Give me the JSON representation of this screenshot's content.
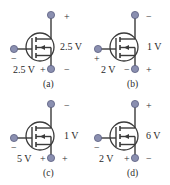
{
  "figure": {
    "colors": {
      "wire": "#3a3a3a",
      "node": "#8a8fb0",
      "text": "#2a2a2a"
    },
    "panels": [
      {
        "id": "a",
        "caption": "(a)",
        "vds_label": "2.5 V",
        "vgs_label": "2.5 V",
        "drain_sign": "+",
        "source_sign_right": "−",
        "source_sign_left": "+",
        "gate_sign": "−"
      },
      {
        "id": "b",
        "caption": "(b)",
        "vds_label": "1 V",
        "vgs_label": "2 V",
        "drain_sign": "−",
        "source_sign_right": "+",
        "source_sign_left": "−",
        "gate_sign": "+"
      },
      {
        "id": "c",
        "caption": "(c)",
        "vds_label": "1 V",
        "vgs_label": "5 V",
        "drain_sign": "−",
        "source_sign_right": "+",
        "source_sign_left": "+",
        "gate_sign": "−"
      },
      {
        "id": "d",
        "caption": "(d)",
        "vds_label": "6 V",
        "vgs_label": "2 V",
        "drain_sign": "+",
        "source_sign_right": "−",
        "source_sign_left": "+",
        "gate_sign": "−"
      }
    ]
  }
}
